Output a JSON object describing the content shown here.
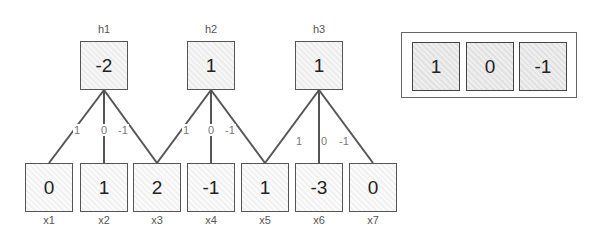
{
  "hidden": [
    {
      "label": "h1",
      "value": "-2"
    },
    {
      "label": "h2",
      "value": "1"
    },
    {
      "label": "h3",
      "value": "1"
    }
  ],
  "inputs": [
    {
      "label": "x1",
      "value": "0"
    },
    {
      "label": "x2",
      "value": "1"
    },
    {
      "label": "x3",
      "value": "2"
    },
    {
      "label": "x4",
      "value": "-1"
    },
    {
      "label": "x5",
      "value": "1"
    },
    {
      "label": "x6",
      "value": "-3"
    },
    {
      "label": "x7",
      "value": "0"
    }
  ],
  "kernel": [
    "1",
    "0",
    "-1"
  ],
  "edge_weights": [
    [
      "1",
      "0",
      "-1"
    ],
    [
      "1",
      "0",
      "-1"
    ],
    [
      "1",
      "0",
      "-1"
    ]
  ],
  "colors": {
    "stroke": "#555555",
    "background": "#ffffff"
  }
}
